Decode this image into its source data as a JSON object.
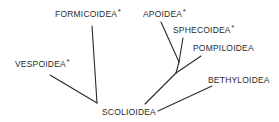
{
  "diagram": {
    "type": "phylogenetic-tree",
    "root": "SCOLIOIDEA",
    "nodes": [
      {
        "id": "formicoidea",
        "label": "FORMICOIDEA",
        "marker": "*",
        "x": 55,
        "y": 9
      },
      {
        "id": "vespoidea",
        "label": "VESPOIDEA",
        "marker": "*",
        "x": 15,
        "y": 59
      },
      {
        "id": "apoidea",
        "label": "APOIDEA",
        "marker": "*",
        "x": 143,
        "y": 9
      },
      {
        "id": "sphecoidea",
        "label": "SPHECOIDEA",
        "marker": "*",
        "x": 173,
        "y": 25
      },
      {
        "id": "pompiloidea",
        "label": "POMPILOIDEA",
        "marker": "",
        "x": 193,
        "y": 43
      },
      {
        "id": "bethyloidea",
        "label": "BETHYLOIDEA",
        "marker": "",
        "x": 208,
        "y": 75
      },
      {
        "id": "scolioidea",
        "label": "SCOLIOIDEA",
        "marker": "",
        "x": 102,
        "y": 107
      }
    ],
    "edges": [
      {
        "from": "formicoidea",
        "to": "scolioidea-left-junction",
        "x1": 92,
        "y1": 26,
        "x2": 97,
        "y2": 103
      },
      {
        "from": "vespoidea",
        "to": "scolioidea-left-junction",
        "x1": 50,
        "y1": 75,
        "x2": 97,
        "y2": 103
      },
      {
        "from": "apoidea",
        "to": "apo-sphec-junction",
        "x1": 161,
        "y1": 22,
        "x2": 179,
        "y2": 62
      },
      {
        "from": "sphecoidea",
        "to": "apo-sphec-junction",
        "x1": 183,
        "y1": 38,
        "x2": 179,
        "y2": 62
      },
      {
        "from": "apo-sphec-junction",
        "to": "pompilo-junction",
        "x1": 179,
        "y1": 62,
        "x2": 176,
        "y2": 73
      },
      {
        "from": "pompiloidea",
        "to": "pompilo-junction",
        "x1": 201,
        "y1": 56,
        "x2": 176,
        "y2": 73
      },
      {
        "from": "pompilo-junction",
        "to": "scolioidea",
        "x1": 176,
        "y1": 73,
        "x2": 145,
        "y2": 104
      },
      {
        "from": "bethyloidea",
        "to": "scolioidea",
        "x1": 212,
        "y1": 86,
        "x2": 158,
        "y2": 111
      }
    ]
  }
}
